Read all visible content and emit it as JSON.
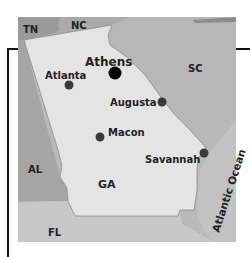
{
  "map": {
    "title": "Georgia",
    "colors": {
      "georgia": "#e4e4e4",
      "neighbors": "#b9b9b9",
      "tn": "#9a9a9a",
      "al": "#a5a5a5",
      "fl": "#c8c8c8",
      "ocean": "#bdbdbd",
      "city_dot": "#3a3a3a",
      "capital_dot": "#000000"
    },
    "states": {
      "tn": "TN",
      "nc": "NC",
      "sc": "SC",
      "al": "AL",
      "fl": "FL",
      "ga": "GA"
    },
    "water": {
      "ocean": "Atlantic Ocean"
    },
    "cities": [
      {
        "name": "Athens"
      },
      {
        "name": "Atlanta"
      },
      {
        "name": "Augusta"
      },
      {
        "name": "Macon"
      },
      {
        "name": "Savannah"
      }
    ]
  }
}
